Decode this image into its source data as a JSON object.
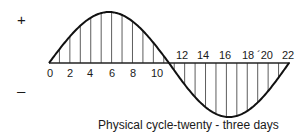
{
  "chart_data": {
    "type": "line",
    "title": "",
    "caption": "Physical cycle-twenty - three days",
    "xlabel": "Physical cycle-twenty - three days",
    "ylabel": "",
    "y_signs": {
      "positive": "+",
      "negative": "–"
    },
    "tick_labels": [
      "0",
      "2",
      "4",
      "6",
      "8",
      "10",
      "12",
      "14",
      "16",
      "18",
      "20",
      "22"
    ],
    "x": [
      0,
      1,
      2,
      3,
      4,
      5,
      6,
      7,
      8,
      9,
      10,
      11,
      11.5,
      12,
      13,
      14,
      15,
      16,
      17,
      18,
      19,
      20,
      21,
      22,
      23
    ],
    "series": [
      {
        "name": "Physical cycle",
        "period_days": 23,
        "shape": "sine",
        "values": [
          0,
          0.27,
          0.52,
          0.73,
          0.89,
          0.98,
          1.0,
          0.94,
          0.82,
          0.63,
          0.4,
          0.14,
          0,
          -0.14,
          -0.4,
          -0.63,
          -0.82,
          -0.94,
          -1.0,
          -0.98,
          -0.89,
          -0.73,
          -0.52,
          -0.27,
          0
        ]
      }
    ],
    "grid": false,
    "hatched_fill": true,
    "ylim": [
      -1,
      1
    ],
    "xlim": [
      0,
      23
    ]
  },
  "labels": {
    "plus": "+",
    "minus": "–",
    "caption": "Physical cycle-twenty - three days",
    "ticks_left": [
      "0",
      "2",
      "4",
      "6",
      "8",
      "10"
    ],
    "ticks_right": [
      "12",
      "14",
      "16",
      "18",
      "´20",
      "22"
    ]
  }
}
